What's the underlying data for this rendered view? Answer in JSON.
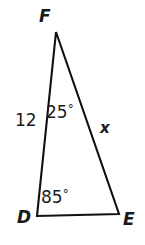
{
  "figure": {
    "shape": "triangle",
    "background_color": "#ffffff",
    "stroke_color": "#111111",
    "stroke_width": 2,
    "text_color": "#1a1a1a"
  },
  "vertices": [
    {
      "name": "F",
      "label": "F",
      "x": 56,
      "y": 32,
      "position": "apex-top"
    },
    {
      "name": "D",
      "label": "D",
      "x": 37,
      "y": 216,
      "position": "bottom-left"
    },
    {
      "name": "E",
      "label": "E",
      "x": 119,
      "y": 214,
      "position": "bottom-right"
    }
  ],
  "sides": [
    {
      "name": "DF",
      "label": "12",
      "value": 12,
      "known": true,
      "position": "left"
    },
    {
      "name": "FE",
      "label": "x",
      "value": null,
      "known": false,
      "position": "right"
    },
    {
      "name": "DE",
      "label": "",
      "value": null,
      "known": false,
      "position": "bottom"
    }
  ],
  "angles": [
    {
      "at_vertex": "F",
      "label": "25°",
      "value": 25,
      "unit": "degrees",
      "digits": "25",
      "degree_symbol": "°"
    },
    {
      "at_vertex": "D",
      "label": "85°",
      "value": 85,
      "unit": "degrees",
      "digits": "85",
      "degree_symbol": "°"
    }
  ],
  "labels": {
    "vertex_F": "F",
    "vertex_D": "D",
    "vertex_E": "E",
    "side_DF": "12",
    "side_FE": "x",
    "angle_F_digits": "25",
    "angle_F_symbol": "°",
    "angle_D_digits": "85",
    "angle_D_symbol": "°"
  },
  "geometry": {
    "polygon_points": "56,32 37,216 119,214",
    "right_angle_marker": false,
    "arc_markers": false
  }
}
